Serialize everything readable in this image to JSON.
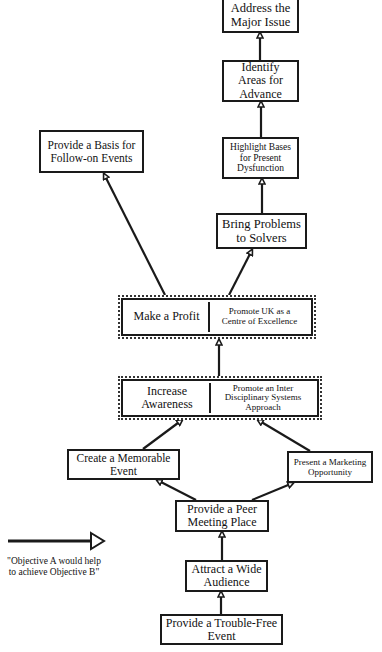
{
  "diagram": {
    "type": "objectives-hierarchy",
    "nodes": [
      {
        "id": "address",
        "label": "Address the Major Issue"
      },
      {
        "id": "identify",
        "label": "Identify Areas for Advance"
      },
      {
        "id": "highlight",
        "label": "Highlight Bases for Present Dysfunction"
      },
      {
        "id": "bring",
        "label": "Bring Problems to Solvers"
      },
      {
        "id": "basis",
        "label": "Provide a Basis for Follow-on Events"
      },
      {
        "id": "profit",
        "label": "Make a Profit"
      },
      {
        "id": "promote_uk",
        "label": "Promote UK as a Centre of Excellence"
      },
      {
        "id": "awareness",
        "label": "Increase Awareness"
      },
      {
        "id": "promote_inter",
        "label": "Promote an Inter Disciplinary Systems Approach"
      },
      {
        "id": "memorable",
        "label": "Create a Memorable Event"
      },
      {
        "id": "marketing",
        "label": "Present a Marketing Opportunity"
      },
      {
        "id": "peer",
        "label": "Provide a Peer Meeting Place"
      },
      {
        "id": "attract",
        "label": "Attract a Wide Audience"
      },
      {
        "id": "trouble",
        "label": "Provide a Trouble-Free Event"
      }
    ],
    "edges": [
      [
        "identify",
        "address"
      ],
      [
        "highlight",
        "identify"
      ],
      [
        "bring",
        "highlight"
      ],
      [
        "promote_uk",
        "bring"
      ],
      [
        "profit",
        "basis"
      ],
      [
        "promote_inter",
        "promote_uk"
      ],
      [
        "memorable",
        "awareness"
      ],
      [
        "marketing",
        "promote_inter"
      ],
      [
        "peer",
        "memorable"
      ],
      [
        "peer",
        "marketing"
      ],
      [
        "attract",
        "peer"
      ],
      [
        "trouble",
        "attract"
      ]
    ],
    "combined_boxes": [
      [
        "profit",
        "promote_uk"
      ],
      [
        "awareness",
        "promote_inter"
      ]
    ]
  },
  "boxes": {
    "address": {
      "l1": "Address the",
      "l2": "Major Issue"
    },
    "identify": {
      "l1": "Identify",
      "l2": "Areas for",
      "l3": "Advance"
    },
    "highlight": {
      "l1": "Highlight Bases",
      "l2": "for Present",
      "l3": "Dysfunction"
    },
    "bring": {
      "l1": "Bring Problems",
      "l2": "to Solvers"
    },
    "basis": {
      "l1": "Provide a Basis for",
      "l2": "Follow-on Events"
    },
    "profit": {
      "l1": "Make a Profit"
    },
    "promote_uk": {
      "l1": "Promote UK as a",
      "l2": "Centre of Excellence"
    },
    "awareness": {
      "l1": "Increase",
      "l2": "Awareness"
    },
    "promote_inter": {
      "l1": "Promote an Inter",
      "l2": "Disciplinary Systems",
      "l3": "Approach"
    },
    "memorable": {
      "l1": "Create a Memorable",
      "l2": "Event"
    },
    "marketing": {
      "l1": "Present a Marketing",
      "l2": "Opportunity"
    },
    "peer": {
      "l1": "Provide a Peer",
      "l2": "Meeting Place"
    },
    "attract": {
      "l1": "Attract a Wide",
      "l2": "Audience"
    },
    "trouble": {
      "l1": "Provide a Trouble-Free",
      "l2": "Event"
    }
  },
  "legend": {
    "arrow_icon": "hollow-arrow-right",
    "l1": "\"Objective A would help",
    "l2": "to achieve Objective B\""
  },
  "colors": {
    "line": "#1a1a1a",
    "background": "#ffffff"
  }
}
